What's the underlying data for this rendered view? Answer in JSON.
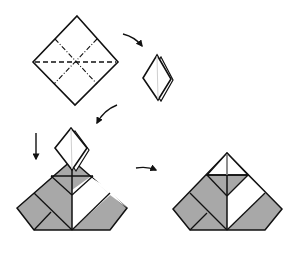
{
  "diagram": {
    "type": "origami-folding-instructions",
    "colors": {
      "line": "#111111",
      "fill_gray": "#a8a8a8",
      "fill_white": "#ffffff",
      "center_line": "#cfcfcf"
    },
    "steps": [
      {
        "id": "step-1",
        "description": "Square diamond with valley fold along horizontal diagonal and mountain folds along the two midlines"
      },
      {
        "id": "step-2",
        "description": "Folded into small preliminary base diamond"
      },
      {
        "id": "step-3",
        "description": "Small diamond placed on top of a partially shaded pyramid-shaped folded unit, with downward arrow"
      },
      {
        "id": "step-4",
        "description": "Resulting assembled pyramid-shaped unit with shaded and white panels"
      }
    ],
    "arrows": [
      {
        "id": "arrow-1",
        "direction": "curved down-right"
      },
      {
        "id": "arrow-2",
        "direction": "curved down-left"
      },
      {
        "id": "arrow-3",
        "direction": "down"
      },
      {
        "id": "arrow-4",
        "direction": "right"
      }
    ]
  }
}
